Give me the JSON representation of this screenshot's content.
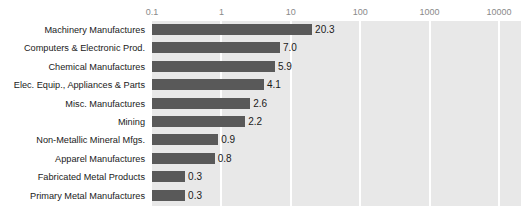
{
  "chart_data": {
    "type": "bar",
    "orientation": "horizontal",
    "title": "",
    "xlabel": "",
    "ylabel": "",
    "xscale": "log",
    "xlim": [
      0.1,
      10000
    ],
    "xticks": [
      "0.1",
      "1",
      "10",
      "100",
      "1000",
      "10000"
    ],
    "xtick_values": [
      0.1,
      1,
      10,
      100,
      1000,
      10000
    ],
    "grid": true,
    "grid_orientation": "vertical",
    "legend": "none",
    "categories": [
      "Machinery Manufactures",
      "Computers & Electronic Prod.",
      "Chemical Manufactures",
      "Elec. Equip., Appliances & Parts",
      "Misc. Manufactures",
      "Mining",
      "Non-Metallic Mineral Mfgs.",
      "Apparel Manufactures",
      "Fabricated Metal Products",
      "Primary Metal Manufactures"
    ],
    "values": [
      20.3,
      7.0,
      5.9,
      4.1,
      2.6,
      2.2,
      0.9,
      0.8,
      0.3,
      0.3
    ],
    "value_labels": [
      "20.3",
      "7.0",
      "5.9",
      "4.1",
      "2.6",
      "2.2",
      "0.9",
      "0.8",
      "0.3",
      "0.3"
    ],
    "colors": {
      "bar": "#595959",
      "plot_background": "#e8e8e8",
      "gridline": "#ffffff",
      "page_background": "#ffffff",
      "tick_label": "#8a8a8a",
      "category_label": "#1a1a1a",
      "value_label": "#1a1a1a"
    }
  },
  "title_remnant": "         "
}
